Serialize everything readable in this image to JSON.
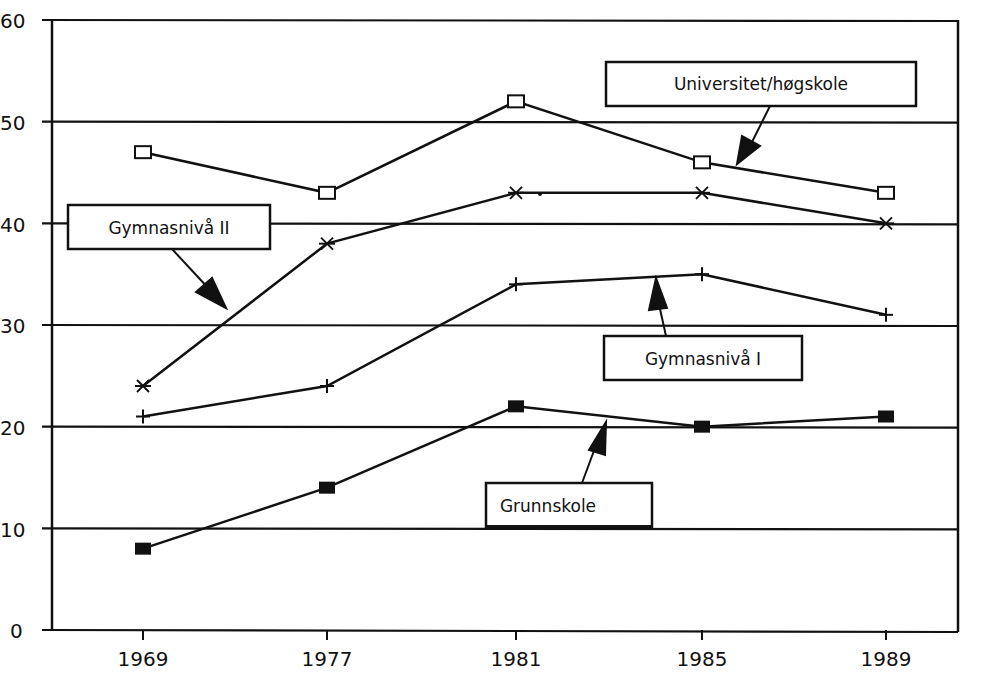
{
  "chart_data": {
    "type": "line",
    "title": "",
    "xlabel": "",
    "ylabel": "",
    "categories": [
      "1969",
      "1977",
      "1981",
      "1985",
      "1989"
    ],
    "ylim": [
      0,
      60
    ],
    "yticks": [
      0,
      10,
      20,
      30,
      40,
      50,
      60
    ],
    "grid": "horizontal",
    "legend": "callout-labels",
    "series": [
      {
        "name": "Universitet/høgskole",
        "marker": "open-square",
        "values": [
          47,
          43,
          52,
          46,
          43
        ]
      },
      {
        "name": "Gymnasnivå II",
        "marker": "asterisk",
        "values": [
          24,
          38,
          43,
          43,
          40
        ]
      },
      {
        "name": "Gymnasnivå I",
        "marker": "plus",
        "values": [
          21,
          24,
          34,
          35,
          31
        ]
      },
      {
        "name": "Grunnskole",
        "marker": "filled-square",
        "values": [
          8,
          14,
          22,
          20,
          21
        ]
      }
    ],
    "annotations": [
      {
        "text": "Universitet/høgskole",
        "box": [
          606,
          62,
          310,
          44
        ],
        "arrow_to": [
          737,
          164
        ]
      },
      {
        "text": "Gymnasnivå II",
        "box": [
          68,
          205,
          202,
          44
        ],
        "arrow_to": [
          226,
          310
        ]
      },
      {
        "text": "Gymnasnivå I",
        "box": [
          604,
          336,
          198,
          44
        ],
        "arrow_to": [
          656,
          278
        ]
      },
      {
        "text": "Grunnskole",
        "box": [
          486,
          483,
          166,
          44
        ],
        "arrow_to": [
          606,
          422
        ]
      }
    ]
  },
  "ytick_labels": [
    "0",
    "10",
    "20",
    "30",
    "40",
    "50",
    "60"
  ],
  "xtick_labels": [
    "1969",
    "1977",
    "1981",
    "1985",
    "1989"
  ],
  "callouts": {
    "uni": "Universitet/høgskole",
    "gym2": "Gymnasnivå II",
    "gym1": "Gymnasnivå I",
    "grunn": "Grunnskole"
  },
  "colors": {
    "ink": "#111111",
    "background": "#ffffff"
  }
}
